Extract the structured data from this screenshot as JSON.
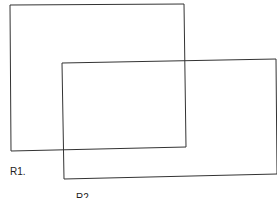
{
  "diagram": {
    "shapes": [
      {
        "id": "R1",
        "label": "R1.",
        "points": "10,5 184,4 186,147 11,151"
      },
      {
        "id": "R2",
        "label": "R2",
        "points": "62,63 276,59 277,174 64,179"
      }
    ],
    "stroke_color": "#333333"
  }
}
